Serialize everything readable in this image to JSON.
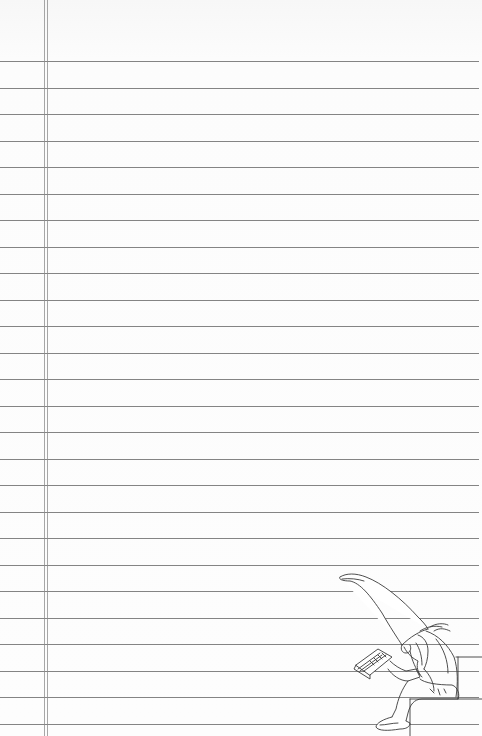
{
  "page": {
    "type": "lined-notebook-paper",
    "background_color": "#fbfbfb",
    "rule_color": "#6f6f6f",
    "margin_line_color": "#8a8a8a",
    "rule_count": 26,
    "first_rule_y": 61,
    "rule_spacing": 26.52,
    "margin_lines_x": [
      44,
      47
    ]
  },
  "illustration": {
    "subject": "gnome-reading-book",
    "description": "Gnome with tall pointed hat sitting on a step reading a book",
    "position": {
      "x": 330,
      "y": 565,
      "width": 152,
      "height": 171
    }
  }
}
